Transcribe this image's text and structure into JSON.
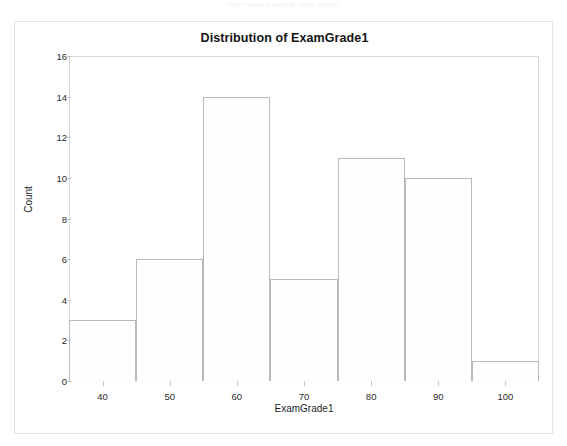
{
  "watermark": {
    "text": "http://www.example-stats-output"
  },
  "figure": {
    "title": "Distribution of ExamGrade1",
    "xlabel": "ExamGrade1",
    "ylabel": "Count",
    "bar_fill_color": "#fefefe",
    "bar_edge_color": "#b9b9bd",
    "frame_color": "#d8d8dc",
    "text_color": "#1a1a1a"
  },
  "chart_data": {
    "type": "bar",
    "title": "Distribution of ExamGrade1",
    "xlabel": "ExamGrade1",
    "ylabel": "Count",
    "xlim": [
      35,
      105
    ],
    "ylim": [
      0,
      16
    ],
    "xticks": [
      40,
      50,
      60,
      70,
      80,
      90,
      100
    ],
    "xtick_labels": [
      "40",
      "50",
      "60",
      "70",
      "80",
      "90",
      "100"
    ],
    "yticks": [
      0,
      2,
      4,
      6,
      8,
      10,
      12,
      14,
      16
    ],
    "ytick_labels": [
      "0",
      "2",
      "4",
      "6",
      "8",
      "10",
      "12",
      "14",
      "16"
    ],
    "grid": false,
    "legend": null,
    "bin_width": 10,
    "bin_edges": [
      35,
      45,
      55,
      65,
      75,
      85,
      95,
      105
    ],
    "categories": [
      "35-45",
      "45-55",
      "55-65",
      "65-75",
      "75-85",
      "85-95",
      "95-105"
    ],
    "values": [
      3,
      6,
      14,
      5,
      11,
      10,
      1
    ],
    "bars": [
      {
        "label": "35-45",
        "left": 35,
        "right": 45,
        "value": 3
      },
      {
        "label": "45-55",
        "left": 45,
        "right": 55,
        "value": 6
      },
      {
        "label": "55-65",
        "left": 55,
        "right": 65,
        "value": 14
      },
      {
        "label": "65-75",
        "left": 65,
        "right": 75,
        "value": 5
      },
      {
        "label": "75-85",
        "left": 75,
        "right": 85,
        "value": 11
      },
      {
        "label": "85-95",
        "left": 85,
        "right": 95,
        "value": 10
      },
      {
        "label": "95-105",
        "left": 95,
        "right": 105,
        "value": 1
      }
    ]
  }
}
